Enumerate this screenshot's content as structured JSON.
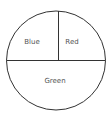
{
  "diagram": {
    "type": "divided-circle",
    "stroke_color": "#333333",
    "background": "#ffffff",
    "regions": [
      {
        "label": "Blue",
        "position": "upper-left"
      },
      {
        "label": "Red",
        "position": "upper-right"
      },
      {
        "label": "Green",
        "position": "lower-half"
      }
    ]
  }
}
